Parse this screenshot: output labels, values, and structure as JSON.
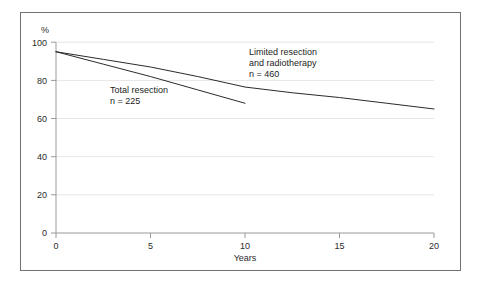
{
  "chart_data": {
    "type": "line",
    "title": "",
    "xlabel": "Years",
    "ylabel": "%",
    "xlim": [
      0,
      20
    ],
    "ylim": [
      0,
      100
    ],
    "xticks": [
      0,
      5,
      10,
      15,
      20
    ],
    "xtick_labels": [
      "0",
      "5",
      "10",
      "15",
      "20"
    ],
    "yticks": [
      0,
      20,
      40,
      60,
      80,
      100
    ],
    "ytick_labels": [
      "0",
      "20",
      "40",
      "60",
      "80",
      "100"
    ],
    "grid": "horizontal",
    "legend_position": "inline-annotation",
    "line_color": "#2b2b2b",
    "grid_color": "#e8e8e8",
    "axis_color": "#9a9a9a",
    "frame_color": "#6f7276",
    "series": [
      {
        "name": "Limited resection and radiotherapy",
        "n": 460,
        "annotation_lines": [
          "Limited resection",
          "and radiotherapy",
          "n = 460"
        ],
        "x": [
          0,
          2.5,
          5,
          7.5,
          10,
          12.5,
          15,
          17.5,
          20
        ],
        "values": [
          95,
          91,
          87,
          82,
          76.5,
          73.5,
          71,
          68,
          65
        ]
      },
      {
        "name": "Total resection",
        "n": 225,
        "annotation_lines": [
          "Total resection",
          "n = 225"
        ],
        "x": [
          0,
          2.5,
          5,
          7.5,
          10
        ],
        "values": [
          95,
          88.5,
          82,
          75,
          68
        ]
      }
    ]
  },
  "annotations": {
    "limited": {
      "line1": "Limited resection",
      "line2": "and radiotherapy",
      "line3": "n = 460"
    },
    "total": {
      "line1": "Total resection",
      "line2": "n = 225"
    }
  },
  "axes": {
    "y_unit": "%",
    "x_title": "Years",
    "y_labels": [
      "100",
      "80",
      "60",
      "40",
      "20",
      "0"
    ],
    "x_labels": [
      "0",
      "5",
      "10",
      "15",
      "20"
    ]
  }
}
